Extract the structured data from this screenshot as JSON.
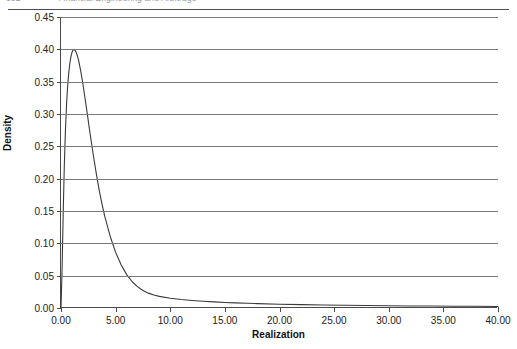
{
  "running_head": {
    "page_number": "332",
    "title": "Financial Engineering and Arbitrage"
  },
  "chart_data": {
    "type": "line",
    "title": "",
    "xlabel": "Realization",
    "ylabel": "Density",
    "xlim": [
      0,
      40
    ],
    "ylim": [
      0,
      0.45
    ],
    "xticks": [
      0,
      5,
      10,
      15,
      20,
      25,
      30,
      35,
      40
    ],
    "xtick_labels": [
      "0.00",
      "5.00",
      "10.00",
      "15.00",
      "20.00",
      "25.00",
      "30.00",
      "35.00",
      "40.00"
    ],
    "yticks": [
      0,
      0.05,
      0.1,
      0.15,
      0.2,
      0.25,
      0.3,
      0.35,
      0.4,
      0.45
    ],
    "ytick_labels": [
      "0.00",
      "0.05",
      "0.10",
      "0.15",
      "0.20",
      "0.25",
      "0.30",
      "0.35",
      "0.40",
      "0.45"
    ],
    "grid": {
      "horizontal": true,
      "vertical": false
    },
    "legend": {
      "show": false,
      "position": "none"
    },
    "line_color": "#3a3a3a",
    "line_width": 1.1,
    "series": [
      {
        "name": "Density",
        "x": [
          0.0,
          0.1,
          0.2,
          0.3,
          0.4,
          0.5,
          0.6,
          0.7,
          0.8,
          0.9,
          1.0,
          1.1,
          1.2,
          1.3,
          1.4,
          1.5,
          1.6,
          1.8,
          2.0,
          2.2,
          2.4,
          2.6,
          2.8,
          3.0,
          3.25,
          3.5,
          3.75,
          4.0,
          4.5,
          5.0,
          5.5,
          6.0,
          6.5,
          7.0,
          7.5,
          8.0,
          8.5,
          9.0,
          10.0,
          11.0,
          12.0,
          13.0,
          14.0,
          15.0,
          16.0,
          17.0,
          18.0,
          20.0,
          22.0,
          24.0,
          26.0,
          28.0,
          30.0,
          32.0,
          34.0,
          36.0,
          38.0,
          40.0
        ],
        "y": [
          0.0,
          0.061,
          0.146,
          0.218,
          0.272,
          0.312,
          0.341,
          0.362,
          0.377,
          0.388,
          0.395,
          0.399,
          0.4,
          0.398,
          0.395,
          0.39,
          0.384,
          0.367,
          0.347,
          0.324,
          0.301,
          0.277,
          0.254,
          0.232,
          0.206,
          0.182,
          0.161,
          0.142,
          0.111,
          0.086,
          0.067,
          0.052,
          0.041,
          0.033,
          0.027,
          0.023,
          0.02,
          0.018,
          0.015,
          0.0131,
          0.0116,
          0.0104,
          0.0094,
          0.0086,
          0.0079,
          0.0073,
          0.0068,
          0.0059,
          0.0052,
          0.0046,
          0.0042,
          0.0038,
          0.0035,
          0.0032,
          0.003,
          0.0028,
          0.0026,
          0.0024
        ],
        "peak": {
          "x": 1.2,
          "y": 0.4
        }
      }
    ]
  }
}
